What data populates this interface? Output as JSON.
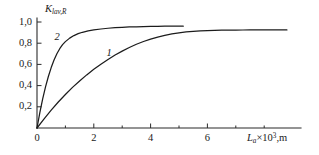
{
  "chart_data": {
    "type": "line",
    "title": "",
    "subtitle": "",
    "xlabel": "L_a×10³, m",
    "ylabel": "K_lav,R",
    "ylabel_parts": {
      "symbol": "K",
      "subscript": "lav,R"
    },
    "xlabel_parts": {
      "symbol": "L",
      "subscript": "a",
      "factor": "×10",
      "exponent": "3",
      "unit": ",m"
    },
    "xlim": [
      0,
      9
    ],
    "ylim": [
      0,
      1.02
    ],
    "grid": false,
    "legend": "inline-curve-labels",
    "decimal_separator": ",",
    "x_ticks_major": [
      0,
      2,
      4,
      6
    ],
    "x_ticks_major_labels": [
      "0",
      "2",
      "4",
      "6"
    ],
    "x_ticks_minor": [
      1,
      3,
      5,
      7,
      8
    ],
    "y_ticks_major": [
      0.2,
      0.4,
      0.6,
      0.8,
      1.0
    ],
    "y_ticks_major_labels": [
      "0,2",
      "0,4",
      "0,6",
      "0,8",
      "1,0"
    ],
    "series": [
      {
        "name": "1",
        "label": "1",
        "label_x": 2.55,
        "label_y": 0.7,
        "color": "#1c1c1c",
        "x": [
          0,
          0.25,
          0.5,
          0.75,
          1.0,
          1.25,
          1.5,
          1.75,
          2.0,
          2.25,
          2.5,
          2.75,
          3.0,
          3.25,
          3.5,
          3.75,
          4.0,
          4.25,
          4.5,
          4.75,
          5.0,
          5.25,
          5.5,
          5.75,
          6.0,
          6.25,
          6.5,
          6.75,
          7.0,
          7.25,
          7.5,
          7.75,
          8.0,
          8.25,
          8.5,
          8.8
        ],
        "y": [
          0,
          0.086,
          0.168,
          0.245,
          0.316,
          0.383,
          0.444,
          0.501,
          0.554,
          0.602,
          0.647,
          0.688,
          0.725,
          0.759,
          0.79,
          0.816,
          0.839,
          0.858,
          0.874,
          0.887,
          0.898,
          0.906,
          0.912,
          0.916,
          0.919,
          0.921,
          0.9225,
          0.9235,
          0.924,
          0.9245,
          0.925,
          0.925,
          0.925,
          0.925,
          0.925,
          0.925
        ]
      },
      {
        "name": "2",
        "label": "2",
        "label_x": 0.72,
        "label_y": 0.845,
        "color": "#1c1c1c",
        "x": [
          0,
          0.1,
          0.2,
          0.3,
          0.4,
          0.5,
          0.6,
          0.7,
          0.8,
          0.9,
          1.0,
          1.15,
          1.3,
          1.45,
          1.6,
          1.8,
          2.0,
          2.25,
          2.5,
          2.75,
          3.0,
          3.25,
          3.5,
          3.75,
          4.0,
          4.25,
          4.5,
          4.75,
          5.0,
          5.15
        ],
        "y": [
          0,
          0.145,
          0.275,
          0.388,
          0.486,
          0.57,
          0.641,
          0.7,
          0.748,
          0.786,
          0.815,
          0.848,
          0.872,
          0.89,
          0.903,
          0.916,
          0.925,
          0.934,
          0.941,
          0.946,
          0.95,
          0.953,
          0.955,
          0.957,
          0.958,
          0.959,
          0.96,
          0.96,
          0.961,
          0.961
        ]
      }
    ],
    "geometry": {
      "origin_px": [
        37,
        128
      ],
      "x_scale_px_per_unit": 28.4,
      "y_scale_px_per_unit": 106.0,
      "y_axis_top_px": 18,
      "x_axis_right_px": 300
    }
  }
}
